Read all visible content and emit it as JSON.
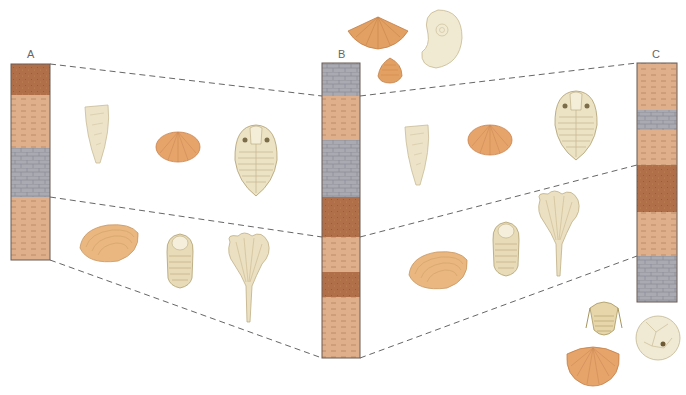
{
  "diagram": {
    "type": "stratigraphic-correlation",
    "columns": [
      {
        "label": "A",
        "x": 11,
        "width": 39,
        "top": 64,
        "bottom": 260,
        "layers": [
          {
            "rock": "sandstone",
            "top": 64,
            "bottom": 95
          },
          {
            "rock": "shale",
            "top": 95,
            "bottom": 148
          },
          {
            "rock": "limestone",
            "top": 148,
            "bottom": 197
          },
          {
            "rock": "shale",
            "top": 197,
            "bottom": 260
          }
        ]
      },
      {
        "label": "B",
        "x": 322,
        "width": 38,
        "top": 63,
        "bottom": 358,
        "layers": [
          {
            "rock": "limestone",
            "top": 63,
            "bottom": 96
          },
          {
            "rock": "shale",
            "top": 96,
            "bottom": 140
          },
          {
            "rock": "limestone",
            "top": 140,
            "bottom": 197
          },
          {
            "rock": "sandstone",
            "top": 197,
            "bottom": 237
          },
          {
            "rock": "shale",
            "top": 237,
            "bottom": 272
          },
          {
            "rock": "sandstone",
            "top": 272,
            "bottom": 297
          },
          {
            "rock": "shale",
            "top": 297,
            "bottom": 358
          }
        ]
      },
      {
        "label": "C",
        "x": 637,
        "width": 40,
        "top": 63,
        "bottom": 302,
        "layers": [
          {
            "rock": "shale",
            "top": 63,
            "bottom": 110
          },
          {
            "rock": "limestone",
            "top": 110,
            "bottom": 130
          },
          {
            "rock": "shale",
            "top": 130,
            "bottom": 165
          },
          {
            "rock": "sandstone",
            "top": 165,
            "bottom": 212
          },
          {
            "rock": "shale",
            "top": 212,
            "bottom": 256
          },
          {
            "rock": "limestone",
            "top": 256,
            "bottom": 302
          }
        ]
      }
    ],
    "correlation_lines": [
      {
        "from": [
          50,
          64
        ],
        "to": [
          322,
          96
        ]
      },
      {
        "from": [
          50,
          197
        ],
        "to": [
          322,
          237
        ]
      },
      {
        "from": [
          50,
          260
        ],
        "to": [
          322,
          358
        ]
      },
      {
        "from": [
          360,
          96
        ],
        "to": [
          637,
          63
        ]
      },
      {
        "from": [
          360,
          237
        ],
        "to": [
          637,
          165
        ]
      },
      {
        "from": [
          360,
          358
        ],
        "to": [
          637,
          256
        ]
      }
    ],
    "fossil_zones": [
      {
        "zone": "upper",
        "fossils": [
          {
            "name": "cone-coral",
            "x": 98,
            "y": 135
          },
          {
            "name": "brachiopod",
            "x": 178,
            "y": 145
          },
          {
            "name": "trilobite-large",
            "x": 256,
            "y": 160
          },
          {
            "name": "cone-coral",
            "x": 418,
            "y": 155
          },
          {
            "name": "brachiopod",
            "x": 490,
            "y": 138
          },
          {
            "name": "trilobite-large",
            "x": 576,
            "y": 125
          }
        ]
      },
      {
        "zone": "lower",
        "fossils": [
          {
            "name": "clam",
            "x": 108,
            "y": 243
          },
          {
            "name": "trilobite-small",
            "x": 180,
            "y": 260
          },
          {
            "name": "crinoid",
            "x": 248,
            "y": 272
          },
          {
            "name": "clam",
            "x": 437,
            "y": 270
          },
          {
            "name": "trilobite-small",
            "x": 506,
            "y": 248
          },
          {
            "name": "crinoid",
            "x": 558,
            "y": 230
          }
        ]
      },
      {
        "zone": "above-B",
        "fossils": [
          {
            "name": "spirifer-brachiopod",
            "x": 378,
            "y": 35
          },
          {
            "name": "ammonite",
            "x": 440,
            "y": 38
          },
          {
            "name": "small-brachiopod",
            "x": 390,
            "y": 70
          }
        ]
      },
      {
        "zone": "below-C",
        "fossils": [
          {
            "name": "trilobite-spined",
            "x": 604,
            "y": 318
          },
          {
            "name": "cystoid",
            "x": 658,
            "y": 338
          },
          {
            "name": "scallop-brachiopod",
            "x": 593,
            "y": 362
          }
        ]
      }
    ],
    "colors": {
      "sandstone": "#b5714a",
      "shale": "#deaf8a",
      "shale_dash": "#b07b58",
      "limestone": "#a9a9b0",
      "limestone_line": "#8e8e96",
      "column_border": "#6a5a55",
      "dashed_line": "#555555",
      "fossil_cream": "#efe6cc",
      "fossil_orange": "#e3a063"
    }
  }
}
